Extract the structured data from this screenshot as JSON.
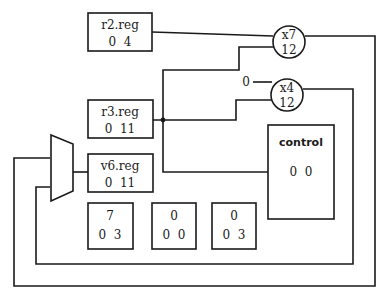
{
  "diagram": {
    "registers": [
      {
        "name": "r2.reg",
        "values": "0  4"
      },
      {
        "name": "r3.reg",
        "values": "0  11"
      },
      {
        "name": "v6.reg",
        "values": "0  11"
      }
    ],
    "operators": [
      {
        "name": "x7",
        "value": "12"
      },
      {
        "name": "x4",
        "value": "12"
      }
    ],
    "constant_input": "0",
    "control": {
      "name": "control",
      "values": "0  0"
    },
    "small_boxes": [
      {
        "top": "7",
        "values": "0  3"
      },
      {
        "top": "0",
        "values": "0  0"
      },
      {
        "top": "0",
        "values": "0  3"
      }
    ],
    "multiplexer": "mux"
  }
}
